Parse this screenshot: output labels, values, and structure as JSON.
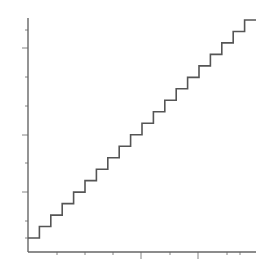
{
  "chart_data": {
    "type": "line",
    "subtype": "step",
    "title": "",
    "xlabel": "",
    "ylabel": "",
    "x": [
      0,
      1,
      2,
      3,
      4,
      5,
      6,
      7,
      8,
      9,
      10,
      11,
      12,
      13,
      14,
      15,
      16,
      17,
      18,
      19,
      20
    ],
    "values": [
      1,
      2,
      3,
      4,
      5,
      6,
      7,
      8,
      9,
      10,
      11,
      12,
      13,
      14,
      15,
      16,
      17,
      18,
      19,
      20,
      20
    ],
    "xlim": [
      0,
      20
    ],
    "ylim": [
      0,
      21
    ],
    "grid": false,
    "legend": null,
    "line_color": "#555555",
    "axis_color": "#666666"
  },
  "layout": {
    "origin_px": [
      28,
      252
    ],
    "x_end_px": 256,
    "y_top_px": 18,
    "step_start_px": [
      28,
      238
    ],
    "step_end_px": [
      256,
      20
    ],
    "steps": 19,
    "x_ticks_px": [
      57,
      85,
      113,
      141,
      170,
      198,
      227,
      240
    ],
    "x_major_ticks_px": [
      141,
      198
    ],
    "y_ticks_px": [
      30,
      48,
      77,
      106,
      135,
      163,
      192,
      221,
      238
    ],
    "y_major_ticks_px": [
      48,
      135,
      192
    ]
  }
}
